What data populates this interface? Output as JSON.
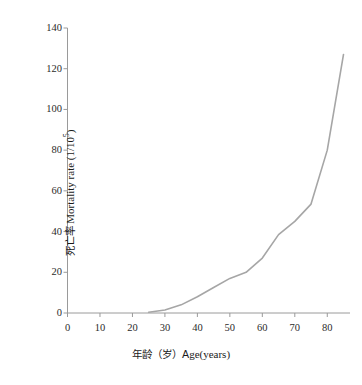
{
  "chart_data": {
    "type": "line",
    "title": "",
    "xlabel": "年龄（岁）Age(years)",
    "ylabel": "死亡率 Mortality rate (1/10",
    "ylabel_sup": "5",
    "ylabel_suffix": ")",
    "xlim": [
      0,
      87
    ],
    "ylim": [
      0,
      140
    ],
    "xticks": [
      0,
      10,
      20,
      30,
      40,
      50,
      60,
      70,
      80
    ],
    "yticks": [
      0,
      20,
      40,
      60,
      80,
      100,
      120,
      140
    ],
    "grid": false,
    "legend": null,
    "series": [
      {
        "name": "Mortality rate",
        "color": "#a6a6a6",
        "x": [
          25,
          30,
          35,
          40,
          45,
          50,
          55,
          60,
          65,
          70,
          75,
          80,
          85
        ],
        "values": [
          0.4,
          1.5,
          4.0,
          8.0,
          12.5,
          17.0,
          20.0,
          27.0,
          38.5,
          45.0,
          53.5,
          80.0,
          127.0
        ]
      }
    ]
  },
  "axis": {
    "x_tick_labels": [
      "0",
      "10",
      "20",
      "30",
      "40",
      "50",
      "60",
      "70",
      "80"
    ],
    "y_tick_labels": [
      "0",
      "20",
      "40",
      "60",
      "80",
      "100",
      "120",
      "140"
    ]
  },
  "colors": {
    "line": "#a6a6a6",
    "axis": "#9a9a9a",
    "text": "#1a1a1a",
    "background": "#ffffff"
  }
}
